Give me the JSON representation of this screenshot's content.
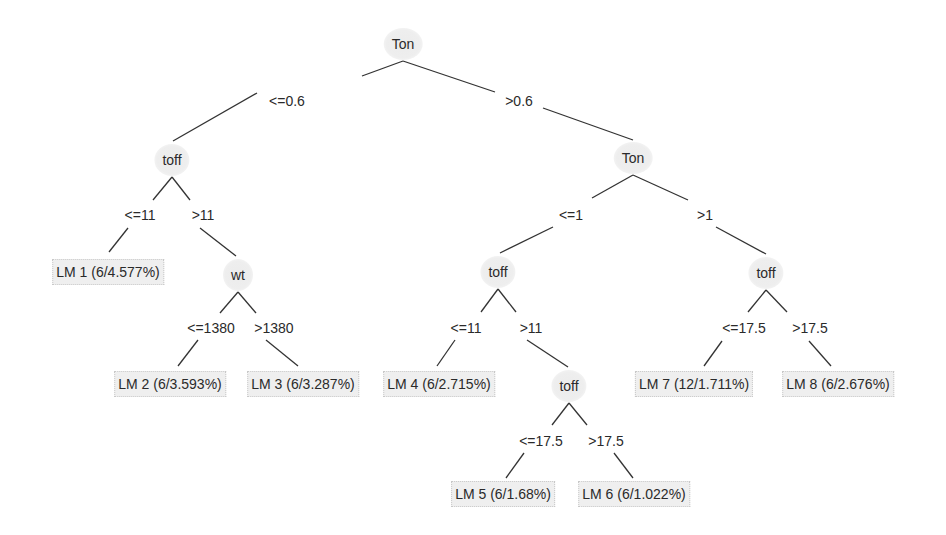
{
  "tree": {
    "nodes": [
      {
        "id": "n0",
        "label": "Ton",
        "x": 403,
        "y": 44
      },
      {
        "id": "n1",
        "label": "toff",
        "x": 172,
        "y": 160
      },
      {
        "id": "n2",
        "label": "wt",
        "x": 238,
        "y": 275
      },
      {
        "id": "n3",
        "label": "Ton",
        "x": 633,
        "y": 158
      },
      {
        "id": "n4",
        "label": "toff",
        "x": 498,
        "y": 272
      },
      {
        "id": "n5",
        "label": "toff",
        "x": 569,
        "y": 386
      },
      {
        "id": "n6",
        "label": "toff",
        "x": 766,
        "y": 273
      }
    ],
    "edge_labels": [
      {
        "label": "<=0.6",
        "x": 287,
        "y": 101
      },
      {
        "label": ">0.6",
        "x": 519,
        "y": 101
      },
      {
        "label": "<=11",
        "x": 140,
        "y": 215
      },
      {
        "label": ">11",
        "x": 203,
        "y": 215
      },
      {
        "label": "<=1",
        "x": 571,
        "y": 215
      },
      {
        "label": ">1",
        "x": 705,
        "y": 215
      },
      {
        "label": "<=1380",
        "x": 211,
        "y": 328
      },
      {
        "label": ">1380",
        "x": 274,
        "y": 328
      },
      {
        "label": "<=11",
        "x": 466,
        "y": 328
      },
      {
        "label": ">11",
        "x": 531,
        "y": 328
      },
      {
        "label": "<=17.5",
        "x": 744,
        "y": 328
      },
      {
        "label": ">17.5",
        "x": 810,
        "y": 328
      },
      {
        "label": "<=17.5",
        "x": 541,
        "y": 441
      },
      {
        "label": ">17.5",
        "x": 606,
        "y": 441
      }
    ],
    "leaves": [
      {
        "id": "lm1",
        "label": "LM 1 (6/4.577%)",
        "x": 108,
        "y": 272
      },
      {
        "id": "lm2",
        "label": "LM 2 (6/3.593%)",
        "x": 170,
        "y": 384
      },
      {
        "id": "lm3",
        "label": "LM 3 (6/3.287%)",
        "x": 303,
        "y": 384
      },
      {
        "id": "lm4",
        "label": "LM 4 (6/2.715%)",
        "x": 439,
        "y": 384
      },
      {
        "id": "lm5",
        "label": "LM 5 (6/1.68%)",
        "x": 503,
        "y": 494
      },
      {
        "id": "lm6",
        "label": "LM 6 (6/1.022%)",
        "x": 634,
        "y": 494
      },
      {
        "id": "lm7",
        "label": "LM 7 (12/1.711%)",
        "x": 694,
        "y": 384
      },
      {
        "id": "lm8",
        "label": "LM 8 (6/2.676%)",
        "x": 838,
        "y": 384
      }
    ],
    "edges": [
      [
        403,
        61,
        362,
        76
      ],
      [
        257,
        93,
        173,
        141
      ],
      [
        403,
        61,
        495,
        92
      ],
      [
        543,
        108,
        633,
        140
      ],
      [
        172,
        177,
        153,
        200
      ],
      [
        172,
        177,
        190,
        200
      ],
      [
        128,
        228,
        109,
        252
      ],
      [
        200,
        228,
        236,
        256
      ],
      [
        238,
        292,
        220,
        313
      ],
      [
        238,
        292,
        256,
        313
      ],
      [
        198,
        340,
        178,
        366
      ],
      [
        266,
        340,
        298,
        366
      ],
      [
        633,
        175,
        592,
        198
      ],
      [
        553,
        227,
        500,
        253
      ],
      [
        633,
        175,
        688,
        200
      ],
      [
        716,
        227,
        766,
        254
      ],
      [
        498,
        289,
        481,
        312
      ],
      [
        498,
        289,
        516,
        312
      ],
      [
        455,
        340,
        437,
        366
      ],
      [
        527,
        340,
        568,
        367
      ],
      [
        766,
        290,
        748,
        312
      ],
      [
        766,
        290,
        787,
        312
      ],
      [
        722,
        341,
        704,
        366
      ],
      [
        809,
        341,
        831,
        366
      ],
      [
        569,
        403,
        552,
        425
      ],
      [
        569,
        403,
        587,
        425
      ],
      [
        524,
        453,
        506,
        478
      ],
      [
        614,
        453,
        633,
        478
      ]
    ]
  }
}
